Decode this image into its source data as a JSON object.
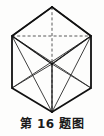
{
  "figure": {
    "caption": "第 16 题图",
    "caption_number": "16",
    "type": "isometric-cube-with-diagonals",
    "stroke_color": "#1a1a1a",
    "dashed_color": "#555555",
    "background_color": "#fdfdfc",
    "geometry": {
      "note": "Cube in isometric projection: outer hexagon silhouette, front-bottom corner, hidden back corner, face diagonals.",
      "outer_hexagon": [
        {
          "name": "top",
          "x": 52,
          "y": 7
        },
        {
          "name": "upper-right",
          "x": 91,
          "y": 36
        },
        {
          "name": "lower-right",
          "x": 91,
          "y": 88
        },
        {
          "name": "bottom",
          "x": 52,
          "y": 112
        },
        {
          "name": "lower-left",
          "x": 12,
          "y": 88
        },
        {
          "name": "upper-left",
          "x": 12,
          "y": 36
        }
      ],
      "center_vertex": {
        "name": "near-corner",
        "x": 52,
        "y": 64
      },
      "hidden_vertex": {
        "name": "far-corner",
        "x": 52,
        "y": 64
      },
      "solid_edges": [
        "top-to-upper-right",
        "upper-right-to-lower-right",
        "lower-right-to-bottom",
        "bottom-to-lower-left",
        "lower-left-to-upper-left",
        "upper-left-to-top",
        "upper-left-to-center",
        "upper-right-to-center",
        "bottom-to-center"
      ],
      "dashed_edges": [
        "top-to-center-vertical",
        "upper-left-to-upper-right-horizontal",
        "upper-left-to-lower-right-diagonal",
        "upper-right-to-lower-left-diagonal"
      ],
      "solid_diagonals": [
        "upper-left-to-bottom",
        "upper-right-to-bottom",
        "upper-left-to-lower-right",
        "upper-right-to-lower-left",
        "top-to-upper-left-face",
        "top-to-upper-right-face"
      ]
    }
  }
}
